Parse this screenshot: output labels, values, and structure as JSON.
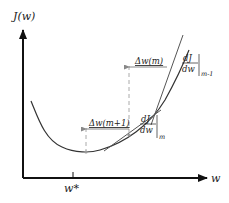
{
  "diagram": {
    "y_axis_label": "J(w)",
    "x_axis_label": "w",
    "x_tick_label": "w*",
    "step_m_label": "Δw(m)",
    "step_m1_label": "Δw(m+1)",
    "grad_m_minus_1": {
      "numerator": "dJ",
      "denominator": "dw",
      "subscript": "m-1"
    },
    "grad_m": {
      "numerator": "dJ",
      "denominator": "dw",
      "subscript": "m"
    },
    "colors": {
      "axis": "#111111",
      "curve": "#333333",
      "tangent": "#555555",
      "step_arrow": "#888888",
      "dashed": "#aaaaaa",
      "point": "#999999"
    }
  }
}
